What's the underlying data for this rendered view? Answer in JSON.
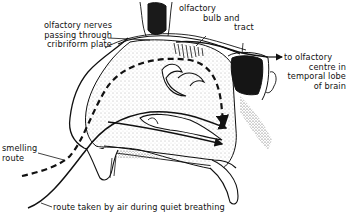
{
  "diagram": {
    "labels": {
      "olfactory_nerves": [
        "olfactory nerves",
        "passing through",
        "cribriform plate"
      ],
      "olfactory_bulb": [
        "olfactory",
        "bulb and",
        "tract"
      ],
      "to_brain": [
        "to olfactory",
        "centre in",
        "temporal lobe",
        "of brain"
      ],
      "smelling_route": [
        "smelling",
        "route"
      ],
      "quiet_breathing": "route taken by air during quiet breathing"
    },
    "colors": {
      "ink": "#111111",
      "paper": "#ffffff",
      "stipple": "#bdbdbd"
    }
  }
}
